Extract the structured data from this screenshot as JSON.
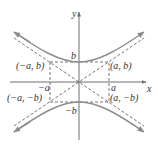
{
  "figure": {
    "type": "hyperbola",
    "equation_form": "y^2/b^2 - x^2/a^2 = 1",
    "axes": {
      "x_label": "x",
      "y_label": "y"
    },
    "labels": {
      "b": "b",
      "neg_b": "−b",
      "a": "a",
      "neg_a": "−a",
      "point_neg_a_b": "(−a, b)",
      "point_a_b": "(a, b)",
      "point_neg_a_neg_b": "(−a, −b)",
      "point_a_neg_b": "(a, −b)"
    },
    "colors": {
      "curve": "#8c8c8c",
      "axis": "#6e6e6e",
      "dashed": "#555555",
      "text": "#333333"
    }
  }
}
